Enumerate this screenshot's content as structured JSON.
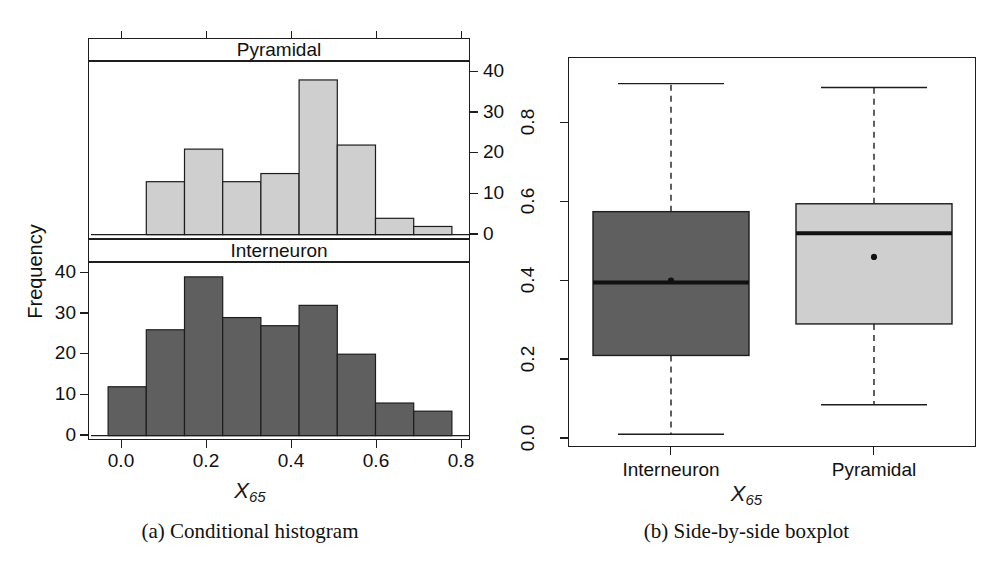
{
  "figure": {
    "subfigures": [
      {
        "id": "a",
        "caption": "(a) Conditional histogram"
      },
      {
        "id": "b",
        "caption": "(b) Side-by-side boxplot"
      }
    ]
  },
  "histogram": {
    "ylabel": "Frequency",
    "xlabel_base": "X",
    "xlabel_sub": "65",
    "strip_top": "Pyramidal",
    "strip_bottom": "Interneuron",
    "x_ticks": [
      "0.0",
      "0.2",
      "0.4",
      "0.6",
      "0.8"
    ],
    "y_ticks_left": [
      "0",
      "10",
      "20",
      "30",
      "40"
    ],
    "y_ticks_right": [
      "0",
      "10",
      "20",
      "30",
      "40"
    ],
    "fill_top": "#cfcfcf",
    "fill_bottom": "#5f5f5f",
    "stroke": "#1d1d1d"
  },
  "boxplot": {
    "xlabel_base": "X",
    "xlabel_sub": "65",
    "y_ticks": [
      "0.0",
      "0.2",
      "0.4",
      "0.6",
      "0.8"
    ],
    "category_labels": [
      "Interneuron",
      "Pyramidal"
    ],
    "fill_interneuron": "#5f5f5f",
    "fill_pyramidal": "#cfcfcf",
    "stroke": "#1d1d1d"
  },
  "chart_data": [
    {
      "type": "bar",
      "title": "Conditional histogram",
      "subtitle": "(a)",
      "xlabel": "X_65",
      "ylabel": "Frequency",
      "xlim": [
        -0.05,
        0.95
      ],
      "ylim": [
        0,
        42
      ],
      "grid": false,
      "legend": "panel strips",
      "bin_width": 0.1,
      "bin_edges": [
        0.0,
        0.1,
        0.2,
        0.3,
        0.4,
        0.5,
        0.6,
        0.7,
        0.8,
        0.9
      ],
      "panels": [
        {
          "name": "Pyramidal",
          "position": "top",
          "fill": "#cfcfcf",
          "bin_starts": [
            0.1,
            0.2,
            0.3,
            0.4,
            0.5,
            0.6,
            0.7,
            0.8
          ],
          "values": [
            13,
            21,
            13,
            15,
            38,
            22,
            4,
            2
          ],
          "yticks": [
            0,
            10,
            20,
            30,
            40
          ],
          "axis_side": "right"
        },
        {
          "name": "Interneuron",
          "position": "bottom",
          "fill": "#5f5f5f",
          "bin_starts": [
            0.0,
            0.1,
            0.2,
            0.3,
            0.4,
            0.5,
            0.6,
            0.7,
            0.8
          ],
          "values": [
            12,
            26,
            39,
            29,
            27,
            32,
            20,
            8,
            6
          ],
          "yticks": [
            0,
            10,
            20,
            30,
            40
          ],
          "axis_side": "left"
        }
      ]
    },
    {
      "type": "boxplot",
      "title": "Side-by-side boxplot",
      "subtitle": "(b)",
      "xlabel": "X_65",
      "ylabel": "",
      "ylim": [
        -0.02,
        0.95
      ],
      "yticks": [
        0.0,
        0.2,
        0.4,
        0.6,
        0.8
      ],
      "grid": false,
      "categories": [
        "Interneuron",
        "Pyramidal"
      ],
      "boxes": [
        {
          "name": "Interneuron",
          "fill": "#5f5f5f",
          "whisker_low": 0.01,
          "q1": 0.21,
          "median": 0.395,
          "q3": 0.575,
          "whisker_high": 0.9,
          "mean": 0.4
        },
        {
          "name": "Pyramidal",
          "fill": "#cfcfcf",
          "whisker_low": 0.085,
          "q1": 0.29,
          "median": 0.52,
          "q3": 0.595,
          "whisker_high": 0.89,
          "mean": 0.46
        }
      ]
    }
  ]
}
